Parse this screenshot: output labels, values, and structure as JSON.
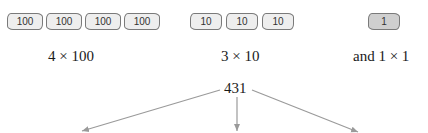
{
  "groups": [
    {
      "tiles": [
        {
          "value": "100",
          "x": 7,
          "w": 36
        },
        {
          "value": "100",
          "x": 46,
          "w": 36
        },
        {
          "value": "100",
          "x": 85,
          "w": 36
        },
        {
          "value": "100",
          "x": 124,
          "w": 36
        }
      ],
      "label": "4 × 100"
    },
    {
      "tiles": [
        {
          "value": "10",
          "x": 190,
          "w": 32
        },
        {
          "value": "10",
          "x": 226,
          "w": 32
        },
        {
          "value": "10",
          "x": 262,
          "w": 32
        }
      ],
      "label": "3 × 10"
    },
    {
      "tiles": [
        {
          "value": "1",
          "x": 368,
          "w": 32
        }
      ],
      "label": "and 1 × 1"
    }
  ],
  "total": "431",
  "colors": {
    "tile_fill": "#eeeeee",
    "unit_tile_fill": "#cfcfcf",
    "tile_border": "#7a7a7a",
    "arrow": "#9a9a9a",
    "text": "#1a1a1a"
  }
}
